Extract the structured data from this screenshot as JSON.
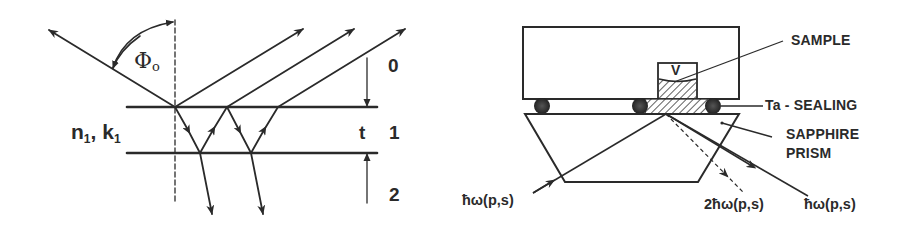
{
  "left_diagram": {
    "title": "Thin film multiple reflection geometry",
    "angle_label": "Φ",
    "angle_subscript": "o",
    "layer_material_n": "n",
    "layer_material_n_sub": "1",
    "layer_material_sep": ", ",
    "layer_material_k": "k",
    "layer_material_k_sub": "1",
    "thickness_label": "t",
    "medium_labels": [
      "0",
      "1",
      "2"
    ]
  },
  "right_diagram": {
    "title": "Sample cell on sapphire prism",
    "sample_label": "SAMPLE",
    "sample_box_letter": "V",
    "sealing_label": "Ta - SEALING",
    "prism_label_line1": "SAPPHIRE",
    "prism_label_line2": "PRISM",
    "beam_in_label": "ħω(p,s)",
    "beam_shg_label": "2ħω(p,s)",
    "beam_out_label": "ħω(p,s)"
  },
  "colors": {
    "ink": "#2a2a2a",
    "background": "#ffffff"
  }
}
